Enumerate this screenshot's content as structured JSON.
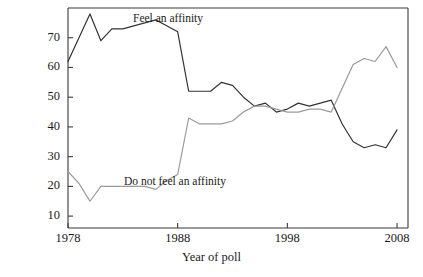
{
  "figure": {
    "clipped_top_text": "",
    "background": "#ffffff"
  },
  "axes": {
    "x_title": "Year of poll",
    "y_title": "",
    "x_ticks": [
      "1978",
      "1988",
      "1998",
      "2008"
    ],
    "y_ticks": [
      "10",
      "20",
      "30",
      "40",
      "50",
      "60",
      "70"
    ],
    "frame_color": "#3a3a3a"
  },
  "annotations": {
    "affinity_label": "Feel an affinity",
    "no_affinity_label": "Do not feel an affinity"
  },
  "colors": {
    "affinity_line": "#333333",
    "no_affinity_line": "#9a9a9a",
    "axis": "#3a3a3a",
    "text": "#1a1a1a"
  },
  "chart_data": {
    "type": "line",
    "title": "",
    "xlabel": "Year of poll",
    "ylabel": "",
    "xlim": [
      1978,
      2009
    ],
    "ylim": [
      6,
      80
    ],
    "grid": false,
    "legend": "inline-annotations",
    "x": [
      1978,
      1979,
      1980,
      1981,
      1982,
      1983,
      1984,
      1985,
      1986,
      1987,
      1988,
      1989,
      1990,
      1991,
      1992,
      1993,
      1994,
      1995,
      1996,
      1997,
      1998,
      1999,
      2000,
      2001,
      2002,
      2003,
      2004,
      2005,
      2006,
      2007,
      2008
    ],
    "series": [
      {
        "name": "Feel an affinity",
        "color": "#333333",
        "values": [
          62,
          70,
          78,
          69,
          73,
          73,
          74,
          75,
          76,
          74,
          72,
          52,
          52,
          52,
          55,
          54,
          50,
          47,
          48,
          45,
          46,
          48,
          47,
          48,
          49,
          41,
          35,
          33,
          34,
          33,
          39
        ]
      },
      {
        "name": "Do not feel an affinity",
        "color": "#9a9a9a",
        "values": [
          25,
          21,
          15,
          20,
          20,
          20,
          20,
          20,
          19,
          22,
          24,
          43,
          41,
          41,
          41,
          42,
          45,
          47,
          47,
          46,
          45,
          45,
          46,
          46,
          45,
          53,
          61,
          63,
          62,
          67,
          60
        ]
      }
    ]
  }
}
